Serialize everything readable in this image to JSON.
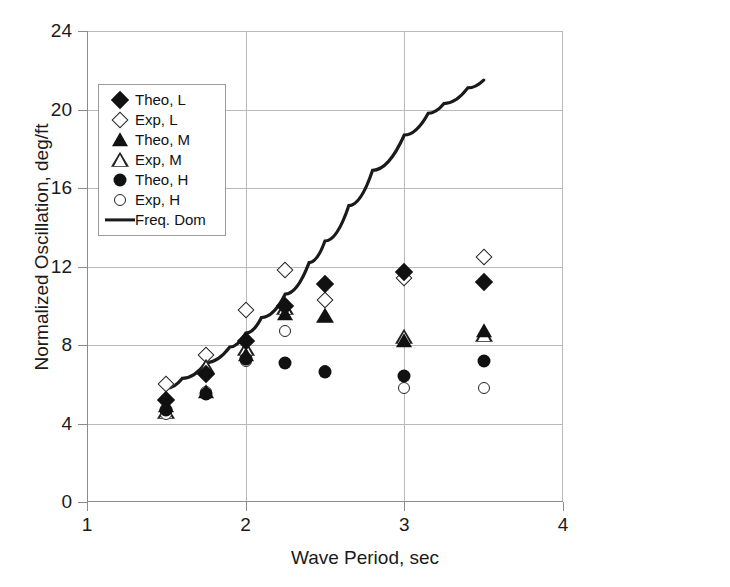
{
  "chart_data": {
    "type": "scatter",
    "title": "",
    "xlabel": "Wave Period, sec",
    "ylabel": "Normalized Oscillation, deg/ft",
    "xlim": [
      1,
      4
    ],
    "ylim": [
      0,
      24
    ],
    "xticks": [
      "1",
      "2",
      "3",
      "4"
    ],
    "yticks": [
      "0",
      "4",
      "8",
      "12",
      "16",
      "20",
      "24"
    ],
    "xtick_values": [
      1,
      2,
      3,
      4
    ],
    "ytick_values": [
      0,
      4,
      8,
      12,
      16,
      20,
      24
    ],
    "grid": true,
    "legend_position": "upper-left",
    "series": [
      {
        "name": "Theo, L",
        "marker": "diamond-filled",
        "x": [
          1.5,
          1.75,
          2.0,
          2.25,
          2.5,
          3.0,
          3.5
        ],
        "y": [
          5.2,
          6.5,
          8.2,
          10.0,
          11.1,
          11.7,
          11.2
        ]
      },
      {
        "name": "Exp, L",
        "marker": "diamond-open",
        "x": [
          1.5,
          1.75,
          2.0,
          2.25,
          2.5,
          3.0,
          3.5
        ],
        "y": [
          6.0,
          7.5,
          9.8,
          11.8,
          10.3,
          11.4,
          12.5
        ]
      },
      {
        "name": "Theo, M",
        "marker": "triangle-filled",
        "x": [
          1.5,
          1.75,
          2.0,
          2.25,
          2.5,
          3.0,
          3.5
        ],
        "y": [
          4.9,
          5.6,
          7.5,
          9.6,
          9.5,
          8.2,
          8.7
        ]
      },
      {
        "name": "Exp, M",
        "marker": "triangle-open",
        "x": [
          1.5,
          1.75,
          2.0,
          2.25,
          2.5,
          3.0,
          3.5
        ],
        "y": [
          4.6,
          6.9,
          7.8,
          9.9,
          9.5,
          8.4,
          8.5
        ]
      },
      {
        "name": "Theo, H",
        "marker": "circle-filled",
        "x": [
          1.5,
          1.75,
          2.0,
          2.25,
          2.5,
          3.0,
          3.5
        ],
        "y": [
          4.7,
          5.5,
          7.3,
          7.1,
          6.6,
          6.4,
          7.2
        ]
      },
      {
        "name": "Exp, H",
        "marker": "circle-open",
        "x": [
          1.5,
          1.75,
          2.0,
          2.25,
          2.5,
          3.0,
          3.5
        ],
        "y": [
          4.5,
          5.6,
          7.2,
          8.7,
          6.7,
          5.8,
          5.8
        ]
      },
      {
        "name": "Freq. Dom",
        "marker": "line",
        "x": [
          1.5,
          1.6,
          1.75,
          1.9,
          2.0,
          2.1,
          2.25,
          2.4,
          2.5,
          2.65,
          2.8,
          3.0,
          3.15,
          3.25,
          3.4,
          3.5
        ],
        "y": [
          5.8,
          6.3,
          7.1,
          7.9,
          8.6,
          9.4,
          10.6,
          12.2,
          13.3,
          15.1,
          16.9,
          18.7,
          19.8,
          20.3,
          21.1,
          21.5
        ]
      }
    ]
  },
  "legend": {
    "items": [
      {
        "label": "Theo, L",
        "marker": "diamond-filled"
      },
      {
        "label": "Exp, L",
        "marker": "diamond-open"
      },
      {
        "label": "Theo, M",
        "marker": "triangle-filled"
      },
      {
        "label": "Exp, M",
        "marker": "triangle-open"
      },
      {
        "label": "Theo, H",
        "marker": "circle-filled"
      },
      {
        "label": "Exp, H",
        "marker": "circle-open"
      },
      {
        "label": "Freq. Dom",
        "marker": "line"
      }
    ]
  },
  "colors": {
    "marker": "#111111",
    "curve": "#1a1a1a",
    "grid": "#b9b9bd",
    "axis": "#8c8c90",
    "background": "#ffffff"
  }
}
